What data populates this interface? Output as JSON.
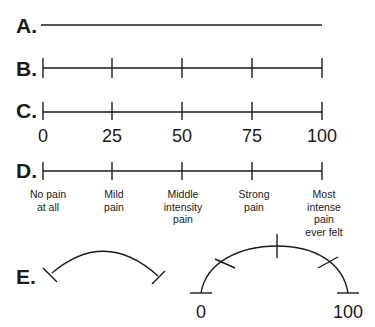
{
  "scales": {
    "A": {
      "label": "A.",
      "type": "visual analog line, no ticks"
    },
    "B": {
      "label": "B.",
      "ticks": 5
    },
    "C": {
      "label": "C.",
      "tick_labels": [
        "0",
        "25",
        "50",
        "75",
        "100"
      ]
    },
    "D": {
      "label": "D.",
      "descriptors": [
        "No pain\nat all",
        "Mild\npain",
        "Middle\nintensity\npain",
        "Strong\npain",
        "Most\nintense\npain\never felt"
      ]
    },
    "E": {
      "label": "E.",
      "left_arc": "unmarked curved line",
      "right_arc_labels": [
        "0",
        "100"
      ]
    }
  },
  "colors": {
    "ink": "#1a1a1a",
    "background": "#ffffff"
  }
}
